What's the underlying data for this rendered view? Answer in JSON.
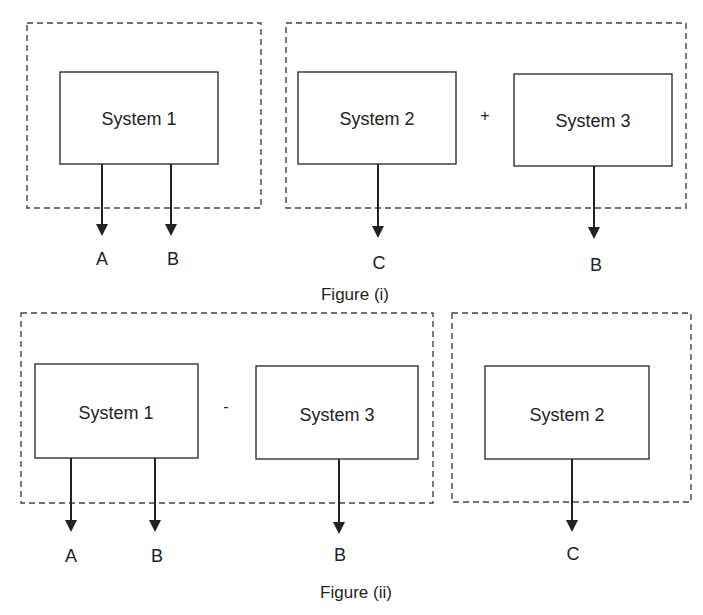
{
  "figure_i": {
    "caption": "Figure (i)",
    "group_left": {
      "system": "System 1",
      "outputs": [
        "A",
        "B"
      ]
    },
    "group_right": {
      "system_a": "System 2",
      "operator": "+",
      "system_b": "System 3",
      "outputs": [
        "C",
        "B"
      ]
    }
  },
  "figure_ii": {
    "caption": "Figure (ii)",
    "group_left": {
      "system_a": "System 1",
      "operator": "-",
      "system_b": "System 3",
      "outputs": [
        "A",
        "B",
        "B"
      ]
    },
    "group_right": {
      "system": "System 2",
      "outputs": [
        "C"
      ]
    }
  }
}
